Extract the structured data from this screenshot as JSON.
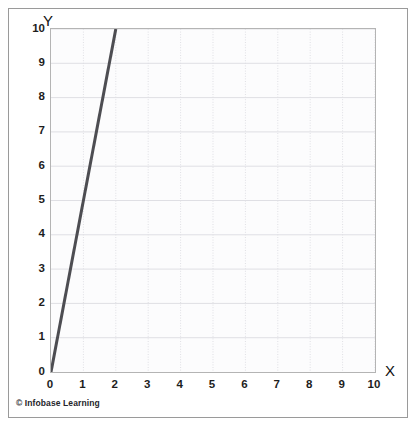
{
  "figure": {
    "credit": "© Infobase Learning",
    "frame_color": "#9a9a9a",
    "plot_border_color": "#b4b4b4",
    "plot_background": "#fcfcfd"
  },
  "chart_data": {
    "type": "line",
    "title": "",
    "xlabel": "X",
    "ylabel": "Y",
    "xlim": [
      0,
      10
    ],
    "ylim": [
      0,
      10
    ],
    "xticks": [
      0,
      1,
      2,
      3,
      4,
      5,
      6,
      7,
      8,
      9,
      10
    ],
    "yticks": [
      0,
      1,
      2,
      3,
      4,
      5,
      6,
      7,
      8,
      9,
      10
    ],
    "xtick_labels": [
      "0",
      "1",
      "2",
      "3",
      "4",
      "5",
      "6",
      "7",
      "8",
      "9",
      "10"
    ],
    "ytick_labels": [
      "0",
      "1",
      "2",
      "3",
      "4",
      "5",
      "6",
      "7",
      "8",
      "9",
      "10"
    ],
    "grid": true,
    "grid_color": "#dfdfe4",
    "legend": false,
    "legend_position": "none",
    "series": [
      {
        "name": "y = 5x",
        "color": "#4d4d52",
        "width": 3,
        "x": [
          0,
          2
        ],
        "y": [
          0,
          10
        ],
        "slope": 5,
        "intercept": 0
      }
    ]
  }
}
